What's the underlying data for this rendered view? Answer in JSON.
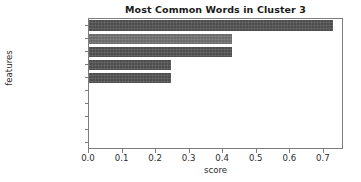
{
  "chart_data": {
    "type": "bar",
    "orientation": "horizontal",
    "title": "Most Common Words in Cluster 3",
    "xlabel": "score",
    "ylabel": "features",
    "categories": [
      "emprecord",
      "warn",
      "memori",
      "util",
      "state",
      "www",
      "failur",
      "em",
      "emp_tsm",
      "employee_lm"
    ],
    "values": [
      0.727,
      0.426,
      0.426,
      0.244,
      0.244,
      0.0,
      0.0,
      0.0,
      0.0,
      0.0
    ],
    "xticks": [
      "0.0",
      "0.1",
      "0.2",
      "0.3",
      "0.4",
      "0.5",
      "0.6",
      "0.7"
    ],
    "xtick_values": [
      0.0,
      0.1,
      0.2,
      0.3,
      0.4,
      0.5,
      0.6,
      0.7
    ],
    "xlim": [
      0.0,
      0.76
    ],
    "grid": false,
    "legend": false,
    "bar_color": "#4d4d4d"
  }
}
